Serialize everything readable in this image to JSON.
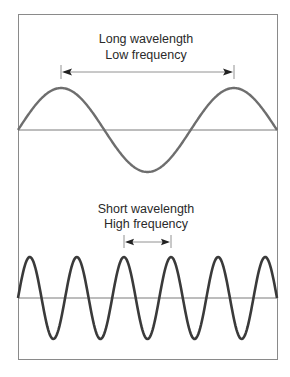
{
  "diagram": {
    "type": "wave-comparison",
    "colors": {
      "frame": "#8a8a8a",
      "axis": "#7a7a7a",
      "long_wave": "#6e6e6e",
      "short_wave": "#3a3a3a",
      "arrow": "#555555"
    },
    "panels": [
      {
        "id": "long",
        "title_line1": "Long wavelength",
        "title_line2": "Low frequency",
        "cycles_shown": 1.5,
        "arrow_spans_cycles": 1
      },
      {
        "id": "short",
        "title_line1": "Short wavelength",
        "title_line2": "High frequency",
        "cycles_shown": 5.5,
        "arrow_spans_cycles": 1
      }
    ]
  }
}
